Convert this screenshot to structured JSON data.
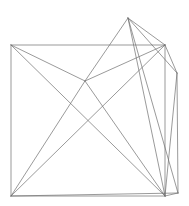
{
  "figure": {
    "type": "line-art",
    "background_color": "#ffffff",
    "stroke_color": "#6e6e6e",
    "stroke_width": 0.7,
    "canvas": {
      "width": 189,
      "height": 206
    }
  },
  "chart_data": {
    "type": "scatter",
    "title": "",
    "xlabel": "",
    "ylabel": "",
    "xlim": [
      0,
      189
    ],
    "ylim": [
      0,
      206
    ],
    "grid": false,
    "legend": "none",
    "vertices": [
      {
        "id": "v0",
        "name": "top-left-corner",
        "x": 11,
        "y": 45
      },
      {
        "id": "v1",
        "name": "top-right-corner",
        "x": 165,
        "y": 45
      },
      {
        "id": "v2",
        "name": "bottom-left-corner",
        "x": 11,
        "y": 196
      },
      {
        "id": "v3",
        "name": "bottom-right-corner",
        "x": 165,
        "y": 196
      },
      {
        "id": "v4",
        "name": "top-apex",
        "x": 128,
        "y": 18
      },
      {
        "id": "v5",
        "name": "right-outer-vertex",
        "x": 177,
        "y": 73
      },
      {
        "id": "v6",
        "name": "interior-mid-vertex",
        "x": 85,
        "y": 81
      },
      {
        "id": "v7",
        "name": "right-lower-vertex",
        "x": 178,
        "y": 193
      }
    ],
    "edges": [
      {
        "from": "v0",
        "to": "v1",
        "name": "square-top-edge"
      },
      {
        "from": "v1",
        "to": "v3",
        "name": "square-right-edge"
      },
      {
        "from": "v3",
        "to": "v2",
        "name": "square-bottom-edge"
      },
      {
        "from": "v2",
        "to": "v0",
        "name": "square-left-edge"
      },
      {
        "from": "v0",
        "to": "v3",
        "name": "square-diagonal-tl-br"
      },
      {
        "from": "v0",
        "to": "v6",
        "name": "tl-to-mid"
      },
      {
        "from": "v2",
        "to": "v6",
        "name": "bl-to-mid"
      },
      {
        "from": "v6",
        "to": "v4",
        "name": "mid-to-apex"
      },
      {
        "from": "v6",
        "to": "v1",
        "name": "mid-to-tr"
      },
      {
        "from": "v6",
        "to": "v3",
        "name": "mid-to-br"
      },
      {
        "from": "v4",
        "to": "v1",
        "name": "apex-to-tr"
      },
      {
        "from": "v4",
        "to": "v5",
        "name": "apex-to-right-outer"
      },
      {
        "from": "v4",
        "to": "v3",
        "name": "apex-to-br"
      },
      {
        "from": "v4",
        "to": "v7",
        "name": "apex-to-right-lower"
      },
      {
        "from": "v1",
        "to": "v5",
        "name": "tr-to-right-outer"
      },
      {
        "from": "v5",
        "to": "v3",
        "name": "right-outer-to-br"
      },
      {
        "from": "v5",
        "to": "v7",
        "name": "right-outer-to-right-lower"
      },
      {
        "from": "v1",
        "to": "v2",
        "name": "diagonal-tr-bl"
      },
      {
        "from": "v2",
        "to": "v7",
        "name": "bl-to-right-lower"
      },
      {
        "from": "v3",
        "to": "v7",
        "name": "br-to-right-lower"
      }
    ]
  }
}
